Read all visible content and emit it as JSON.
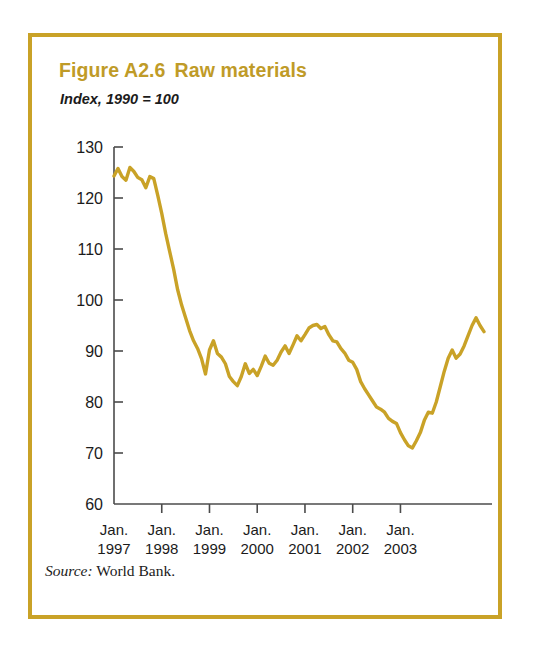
{
  "figure": {
    "number": "Figure A2.6",
    "title": "Raw materials",
    "subtitle": "Index, 1990 = 100",
    "source_label": "Source:",
    "source_text": "World Bank.",
    "border_color": "#c9a227",
    "title_color": "#bf9b28",
    "line_color": "#c9a227"
  },
  "chart_data": {
    "type": "line",
    "subtitle": "Index, 1990 = 100",
    "xlabel": "",
    "ylabel": "Index, 1990 = 100",
    "ylim": [
      60,
      130
    ],
    "yticks": [
      60,
      70,
      80,
      90,
      100,
      110,
      120,
      130
    ],
    "ytick_labels": [
      "60",
      "70",
      "80",
      "90",
      "100",
      "110",
      "120",
      "130"
    ],
    "xtick_labels": [
      {
        "month": "Jan.",
        "year": "1997"
      },
      {
        "month": "Jan.",
        "year": "1998"
      },
      {
        "month": "Jan.",
        "year": "1999"
      },
      {
        "month": "Jan.",
        "year": "2000"
      },
      {
        "month": "Jan.",
        "year": "2001"
      },
      {
        "month": "Jan.",
        "year": "2002"
      },
      {
        "month": "Jan.",
        "year": "2003"
      }
    ],
    "grid": false,
    "legend": false,
    "x_start": "1997-01",
    "x_end": "2003-08",
    "x_unit": "month",
    "series": [
      {
        "name": "Raw materials index",
        "color": "#c9a227",
        "values": [
          124.3,
          125.8,
          124.2,
          123.5,
          126.0,
          125.2,
          124.0,
          123.6,
          122.0,
          124.2,
          123.8,
          120.5,
          117.0,
          113.0,
          109.5,
          106.0,
          102.0,
          99.0,
          96.5,
          94.0,
          92.0,
          90.5,
          88.5,
          85.5,
          90.2,
          92.0,
          89.5,
          88.8,
          87.5,
          85.0,
          84.0,
          83.2,
          85.0,
          87.5,
          85.6,
          86.4,
          85.2,
          87.0,
          89.0,
          87.6,
          87.2,
          88.2,
          89.8,
          91.0,
          89.5,
          91.2,
          93.0,
          92.0,
          93.2,
          94.5,
          95.0,
          95.2,
          94.4,
          94.8,
          93.2,
          92.0,
          91.8,
          90.5,
          89.6,
          88.2,
          87.8,
          86.4,
          84.0,
          82.6,
          81.4,
          80.2,
          79.0,
          78.6,
          78.0,
          76.8,
          76.2,
          75.8,
          74.0,
          72.6,
          71.4,
          71.0,
          72.4,
          74.0,
          76.4,
          78.0,
          77.8,
          80.0,
          83.0,
          86.0,
          88.6,
          90.2,
          88.6,
          89.4,
          91.0,
          93.0,
          95.0,
          96.5,
          95.0,
          93.8
        ]
      }
    ]
  }
}
